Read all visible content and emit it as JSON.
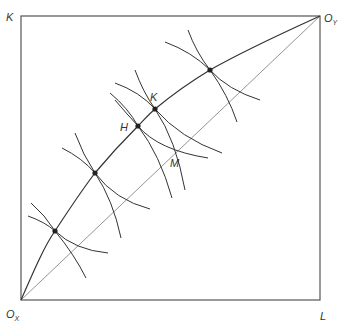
{
  "diagram": {
    "type": "edgeworth-box",
    "colors": {
      "line": "#333333",
      "diagonal": "#777777",
      "background": "#ffffff"
    },
    "corner_labels": {
      "top_left": "K",
      "top_right_main": "O",
      "top_right_sub": "Y",
      "bottom_left_main": "O",
      "bottom_left_sub": "X",
      "bottom_right": "L"
    },
    "point_labels": {
      "H": "H",
      "K": "K",
      "M": "M"
    },
    "contract_curve_points": [
      {
        "name": "point-1",
        "x": 55,
        "y": 231
      },
      {
        "name": "point-2",
        "x": 95,
        "y": 173
      },
      {
        "name": "H",
        "x": 138,
        "y": 126
      },
      {
        "name": "K",
        "x": 155,
        "y": 109
      },
      {
        "name": "point-5",
        "x": 210,
        "y": 70
      }
    ]
  }
}
